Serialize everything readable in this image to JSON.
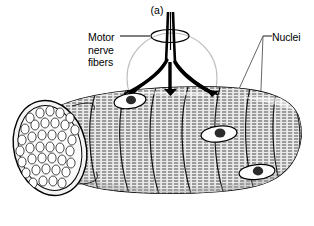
{
  "figure": {
    "caption": "(a)",
    "style": "black-and-white line drawing",
    "labels": [
      {
        "id": "motor-nerve-fibers",
        "lines": [
          "Motor",
          "nerve",
          "fibers"
        ],
        "position": "upper-left",
        "leader": "horizontal dash from 'Motor' to ellipse around nerve trunk"
      },
      {
        "id": "nuclei",
        "lines": [
          "Nuclei"
        ],
        "position": "upper-right",
        "leader": "two lines to middle and lower-right nuclei"
      }
    ],
    "structures": {
      "cross_section": "cut end showing packed myofibrils in ellipse",
      "nerve": "motor nerve trunk branching to motor end plates",
      "nuclei_count": 3,
      "striations": "horizontal hatching across curved myofibril bundles"
    },
    "colors": {
      "ink": "#000000",
      "fill": "#e8e8e8",
      "shade": "#c9c9c9",
      "background": "#ffffff",
      "faint": "#b4b4b4"
    }
  }
}
